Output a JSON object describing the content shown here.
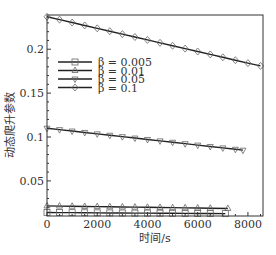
{
  "chart_data": {
    "type": "line",
    "title": "",
    "xlabel": "时间/s",
    "ylabel": "动态爬升参数",
    "xlim": [
      0,
      8600
    ],
    "ylim": [
      0.01,
      0.239
    ],
    "xticks": [
      0,
      2000,
      4000,
      6000,
      8000
    ],
    "xtick_labels": [
      "0",
      "2000",
      "4000",
      "6000",
      "8000"
    ],
    "yticks": [
      0.05,
      0.1,
      0.15,
      0.2
    ],
    "ytick_labels": [
      "0.05",
      "0.1",
      "0.15",
      "0.2"
    ],
    "grid": false,
    "legend_position": "upper left (inside)",
    "series": [
      {
        "name": "β = 0.005",
        "marker": "square",
        "x": [
          0,
          500,
          1000,
          1500,
          2000,
          2500,
          3000,
          3500,
          4000,
          4500,
          5000,
          5500,
          6000,
          6500,
          7100
        ],
        "values": [
          0.014,
          0.0139,
          0.0138,
          0.0137,
          0.0136,
          0.0135,
          0.0134,
          0.0133,
          0.0133,
          0.0132,
          0.0131,
          0.013,
          0.0129,
          0.0128,
          0.0127
        ]
      },
      {
        "name": "β = 0.01",
        "marker": "triangle-up",
        "x": [
          0,
          500,
          1000,
          1500,
          2000,
          2500,
          3000,
          3500,
          4000,
          4500,
          5000,
          5500,
          6000,
          6500,
          7200
        ],
        "values": [
          0.0215,
          0.0213,
          0.0211,
          0.0209,
          0.0207,
          0.0205,
          0.0203,
          0.0201,
          0.0199,
          0.0197,
          0.0195,
          0.0193,
          0.0191,
          0.0189,
          0.0186
        ]
      },
      {
        "name": "β = 0.05",
        "marker": "triangle-down",
        "x": [
          0,
          500,
          1000,
          1500,
          2000,
          2500,
          3000,
          3500,
          4000,
          4500,
          5000,
          5500,
          6000,
          6500,
          7000,
          7500,
          7800
        ],
        "values": [
          0.11,
          0.1084,
          0.1068,
          0.1052,
          0.1036,
          0.102,
          0.1004,
          0.0988,
          0.0972,
          0.0956,
          0.094,
          0.0924,
          0.0908,
          0.0892,
          0.0876,
          0.086,
          0.085
        ]
      },
      {
        "name": "β = 0.1",
        "marker": "diamond",
        "x": [
          0,
          500,
          1000,
          1500,
          2000,
          2500,
          3000,
          3500,
          4000,
          4500,
          5000,
          5500,
          6000,
          6500,
          7000,
          7500,
          8000,
          8500
        ],
        "values": [
          0.237,
          0.2337,
          0.2304,
          0.2271,
          0.2238,
          0.2205,
          0.2172,
          0.2139,
          0.2106,
          0.2073,
          0.204,
          0.2007,
          0.1974,
          0.1941,
          0.1908,
          0.1875,
          0.1842,
          0.181
        ]
      }
    ]
  }
}
